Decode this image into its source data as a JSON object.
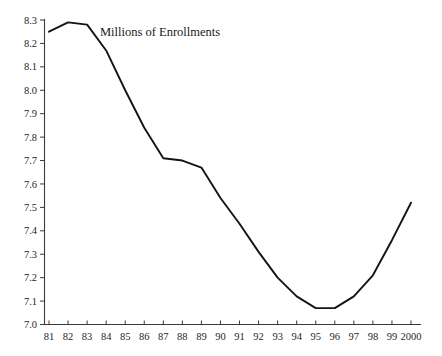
{
  "chart_data": {
    "type": "line",
    "title": "Millions of Enrollments",
    "xlabel": "",
    "ylabel": "",
    "grid": false,
    "legend": "none",
    "xlim": [
      1981,
      2000
    ],
    "ylim": [
      7.0,
      8.3
    ],
    "ytick_step": 0.1,
    "categories": [
      "81",
      "82",
      "83",
      "84",
      "85",
      "86",
      "87",
      "88",
      "89",
      "90",
      "91",
      "92",
      "93",
      "94",
      "95",
      "96",
      "97",
      "98",
      "99",
      "2000"
    ],
    "x": [
      1981,
      1982,
      1983,
      1984,
      1985,
      1986,
      1987,
      1988,
      1989,
      1990,
      1991,
      1992,
      1993,
      1994,
      1995,
      1996,
      1997,
      1998,
      1999,
      2000
    ],
    "values": [
      8.25,
      8.29,
      8.28,
      8.17,
      8.0,
      7.84,
      7.71,
      7.7,
      7.67,
      7.54,
      7.43,
      7.31,
      7.2,
      7.12,
      7.07,
      7.07,
      7.12,
      7.21,
      7.36,
      7.52
    ],
    "ytick_labels": [
      "7.0",
      "7.1",
      "7.2",
      "7.3",
      "7.4",
      "7.5",
      "7.6",
      "7.7",
      "7.8",
      "7.9",
      "8.0",
      "8.1",
      "8.2",
      "8.3"
    ],
    "ytick_values": [
      7.0,
      7.1,
      7.2,
      7.3,
      7.4,
      7.5,
      7.6,
      7.7,
      7.8,
      7.9,
      8.0,
      8.1,
      8.2,
      8.3
    ],
    "series": [
      {
        "name": "Millions of Enrollments",
        "color": "#141414",
        "values": [
          8.25,
          8.29,
          8.28,
          8.17,
          8.0,
          7.84,
          7.71,
          7.7,
          7.67,
          7.54,
          7.43,
          7.31,
          7.2,
          7.12,
          7.07,
          7.07,
          7.12,
          7.21,
          7.36,
          7.52
        ]
      }
    ],
    "axis_color": "#3a3a3a"
  }
}
